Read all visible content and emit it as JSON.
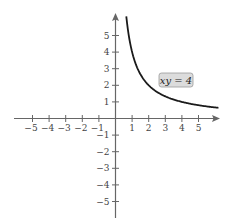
{
  "chart_data": {
    "type": "line",
    "title": "",
    "xlabel": "",
    "ylabel": "",
    "xlim": [
      -5.5,
      6.2
    ],
    "ylim": [
      -5.9,
      6.3
    ],
    "grid": false,
    "legend": null,
    "x_ticks": [
      -5,
      -4,
      -3,
      -2,
      -1,
      1,
      2,
      3,
      4,
      5
    ],
    "y_ticks": [
      5,
      4,
      3,
      2,
      1,
      -1,
      -2,
      -3,
      -4,
      -5
    ],
    "x_tick_labels": [
      "-5",
      "-4",
      "-3",
      "-2",
      "-1",
      "1",
      "2",
      "3",
      "4",
      "5"
    ],
    "y_tick_labels": [
      "5",
      "4",
      "3",
      "2",
      "1",
      "-1",
      "-2",
      "-3",
      "-4",
      "-5"
    ],
    "series": [
      {
        "name": "xy = 4",
        "equation": "y = 4/x",
        "x_range": [
          0.65,
          6.2
        ],
        "color": "#1a1a1a"
      }
    ],
    "annotations": [
      {
        "text": "xy = 4",
        "x": 4.0,
        "y": 2.3,
        "boxed": true,
        "box_color": "#d9d9d9"
      }
    ]
  },
  "colors": {
    "axis": "#666666",
    "curve": "#1a1a1a",
    "label_box_fill": "#dcdcdc",
    "label_box_stroke": "#999999"
  }
}
